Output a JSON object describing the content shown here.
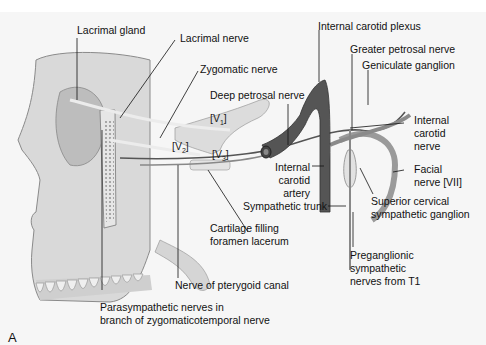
{
  "figure": {
    "panel_label": "A",
    "labels": {
      "lacrimal_gland": "Lacrimal gland",
      "lacrimal_nerve": "Lacrimal nerve",
      "zygomatic_nerve": "Zygomatic nerve",
      "deep_petrosal_nerve": "Deep petrosal nerve",
      "internal_carotid_plexus": "Internal carotid plexus",
      "greater_petrosal_nerve": "Greater petrosal nerve",
      "geniculate_ganglion": "Geniculate ganglion",
      "internal_carotid_nerve": [
        "Internal",
        "carotid",
        "nerve"
      ],
      "facial_nerve": [
        "Facial",
        "nerve [VII]"
      ],
      "internal_carotid_artery": [
        "Internal",
        "carotid",
        "artery"
      ],
      "sympathetic_trunk": "Sympathetic trunk",
      "superior_cervical_ganglion": [
        "Superior cervical",
        "sympathetic ganglion"
      ],
      "cartilage_foramen_lacerum": [
        "Cartilage filling",
        "foramen lacerum"
      ],
      "preganglionic_sympathetic": [
        "Preganglionic",
        "sympathetic",
        "nerves from T1"
      ],
      "nerve_pterygoid_canal": "Nerve of pterygoid canal",
      "parasympathetic_nerves": [
        "Parasympathetic nerves in",
        "branch of zygomaticotemporal nerve"
      ]
    },
    "trigeminal_divisions": {
      "v1": "V",
      "v1_sub": "1",
      "v2": "V",
      "v2_sub": "2",
      "v3": "V",
      "v3_sub": "3"
    }
  }
}
